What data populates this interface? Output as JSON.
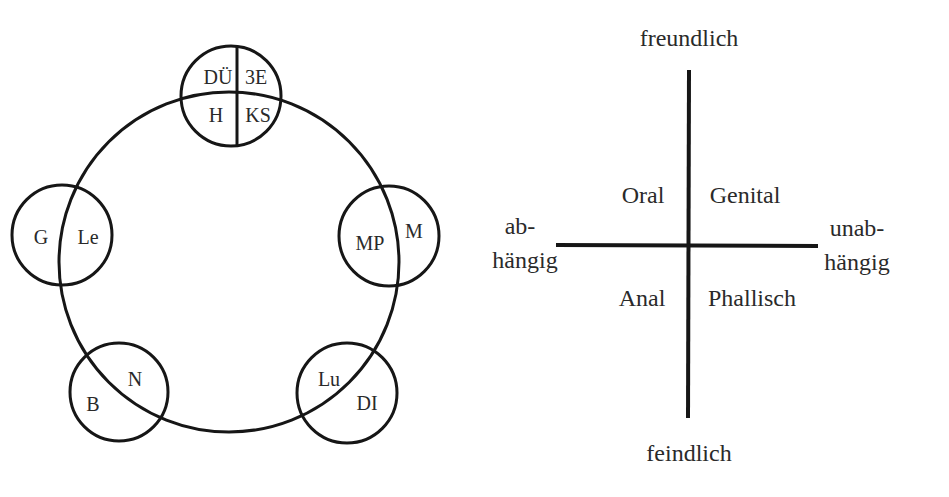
{
  "left_diagram": {
    "name": "Kreis mit fünf Überlappungskreisen",
    "main_circle": {
      "cx": 229,
      "cy": 262,
      "r": 170
    },
    "top_circle": {
      "labels": {
        "top_left": "DÜ",
        "top_right": "3E",
        "bottom_left": "H",
        "bottom_right": "KS"
      }
    },
    "left_circle": {
      "outer": "G",
      "inner": "Le"
    },
    "right_circle": {
      "inner": "MP",
      "outer": "M"
    },
    "bottom_left_circle": {
      "outer": "B",
      "inner": "N"
    },
    "bottom_right_circle": {
      "inner": "Lu",
      "outer": "DI"
    }
  },
  "right_diagram": {
    "axis_top": "freundlich",
    "axis_bottom": "feindlich",
    "axis_left_line1": "ab-",
    "axis_left_line2": "hängig",
    "axis_right_line1": "unab-",
    "axis_right_line2": "hängig",
    "quadrants": {
      "top_left": "Oral",
      "top_right": "Genital",
      "bottom_left": "Anal",
      "bottom_right": "Phallisch"
    }
  },
  "colors": {
    "line": "#161616",
    "text": "#2a2a2a",
    "background": "#ffffff"
  }
}
